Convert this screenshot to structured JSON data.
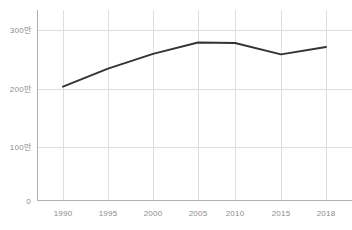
{
  "chart_data": {
    "type": "line",
    "title": "",
    "subtitle": "",
    "xlabel": "",
    "ylabel": "",
    "categories": [
      "1990",
      "1995",
      "2000",
      "2005",
      "2010",
      "2015",
      "2018"
    ],
    "x": [
      1990,
      1995,
      2000,
      2005,
      2010,
      2015,
      2018
    ],
    "values": [
      2000000,
      2320000,
      2580000,
      2780000,
      2770000,
      2570000,
      2700000
    ],
    "series": [
      {
        "name": "",
        "values": [
          2000000,
          2320000,
          2580000,
          2780000,
          2770000,
          2570000,
          2700000
        ]
      }
    ],
    "xlim": [
      1990,
      2018
    ],
    "ylim": [
      0,
      3200000
    ],
    "y_ticks": [
      0,
      1000000,
      2000000,
      3000000
    ],
    "y_tick_labels": [
      "0",
      "100만",
      "200만",
      "300만"
    ],
    "x_tick_labels": [
      "1990",
      "1995",
      "2000",
      "2005",
      "2010",
      "2015",
      "2018"
    ],
    "grid": true,
    "grid_axis": "both",
    "legend": false,
    "legend_position": "none",
    "annotations": []
  },
  "colors": {
    "background": "#ffffff",
    "series_line": "#333333",
    "gridline": "#dededf",
    "axis": "#b0b0b0",
    "tick_text": "#8c8c8c"
  },
  "layout": {
    "plot_left": 37,
    "plot_right": 345,
    "plot_top": 10,
    "plot_bottom": 200,
    "x_pixels": [
      63,
      108,
      153,
      198,
      235,
      281,
      326
    ],
    "y_pixels_ticks": [
      200,
      147,
      89,
      30
    ],
    "y_pixels_points": [
      89,
      68,
      53,
      42,
      43,
      52,
      45
    ]
  }
}
